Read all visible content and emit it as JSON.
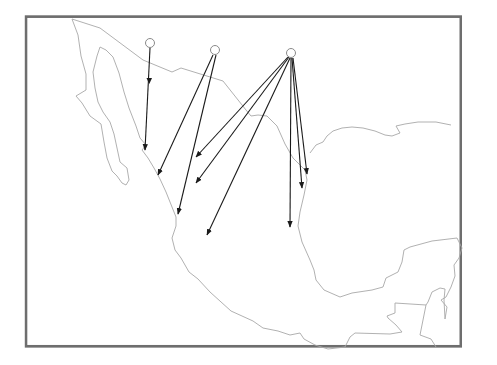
{
  "map": {
    "region": "Mexico and Central America",
    "frame": {
      "x": 25,
      "y": 17,
      "width": 206,
      "height": 148
    },
    "colors": {
      "background": "#ffffff",
      "frame": "#6e6e6e",
      "coastline": "#a8a8a8",
      "arrow": "#1a1a1a",
      "origin_fill": "#ffffff",
      "origin_stroke": "#8a8a8a"
    },
    "origins": [
      {
        "id": "origin-1",
        "x": 150,
        "y": 43
      },
      {
        "id": "origin-2",
        "x": 215,
        "y": 50
      },
      {
        "id": "origin-3",
        "x": 291,
        "y": 53
      }
    ],
    "arrows": [
      {
        "from": "origin-1",
        "x1": 150,
        "y1": 48,
        "x2": 145,
        "y2": 150,
        "mid_arrowhead": true
      },
      {
        "from": "origin-2",
        "x1": 213,
        "y1": 55,
        "x2": 158,
        "y2": 175
      },
      {
        "from": "origin-2",
        "x1": 216,
        "y1": 55,
        "x2": 178,
        "y2": 214
      },
      {
        "from": "origin-3",
        "x1": 288,
        "y1": 57,
        "x2": 196,
        "y2": 157
      },
      {
        "from": "origin-3",
        "x1": 289,
        "y1": 57,
        "x2": 196,
        "y2": 183
      },
      {
        "from": "origin-3",
        "x1": 290,
        "y1": 58,
        "x2": 207,
        "y2": 235
      },
      {
        "from": "origin-3",
        "x1": 291,
        "y1": 58,
        "x2": 290,
        "y2": 227
      },
      {
        "from": "origin-3",
        "x1": 292,
        "y1": 58,
        "x2": 302,
        "y2": 188
      },
      {
        "from": "origin-3",
        "x1": 293,
        "y1": 58,
        "x2": 307,
        "y2": 174
      }
    ]
  }
}
